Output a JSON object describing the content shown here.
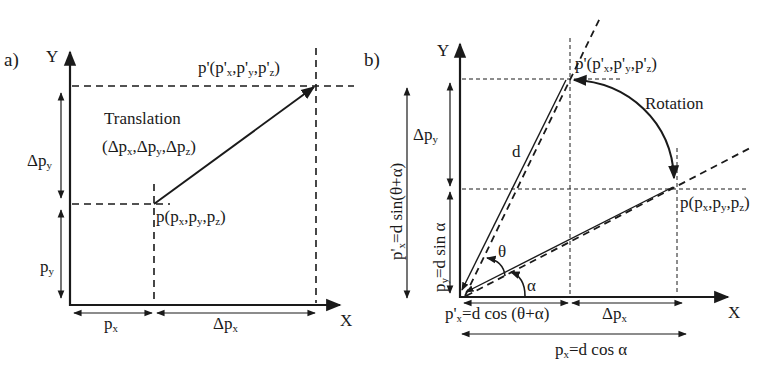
{
  "figure": {
    "background": "#ffffff",
    "ink_color": "#1a1a1a"
  },
  "panel_a": {
    "label": "a)",
    "axis_y": "Y",
    "axis_x": "X",
    "point_new": "p'(p'x,p'y,p'z)",
    "point_new_parts": {
      "p": "p'(p'",
      "x": "x",
      "c1": ",p'",
      "y": "y",
      "c2": ",p'",
      "z": "z",
      "end": ")"
    },
    "point_orig_parts": {
      "p": "p(p",
      "x": "x",
      "c1": ",p",
      "y": "y",
      "c2": ",p",
      "z": "z",
      "end": ")"
    },
    "point_orig": "p(px,py,pz)",
    "transform_title": "Translation",
    "transform_params": "(Δpx,Δpy,Δpz)",
    "transform_parts": {
      "open": "(Δp",
      "x": "x",
      "c1": ",Δp",
      "y": "y",
      "c2": ",Δp",
      "z": "z",
      "end": ")"
    },
    "dim_delta_py": {
      "base": "Δp",
      "sub": "y"
    },
    "dim_py": {
      "base": "p",
      "sub": "y"
    },
    "dim_px": {
      "base": "p",
      "sub": "x"
    },
    "dim_delta_px": {
      "base": "Δp",
      "sub": "x"
    }
  },
  "panel_b": {
    "label": "b)",
    "axis_y": "Y",
    "axis_x": "X",
    "point_new_parts": {
      "p": "p'(p'",
      "x": "x",
      "c1": ",p'",
      "y": "y",
      "c2": ",p'",
      "z": "z",
      "end": ")"
    },
    "point_new": "p'(p'x,p'y,p'z)",
    "point_orig_parts": {
      "p": "p(p",
      "x": "x",
      "c1": ",p",
      "y": "y",
      "c2": ",p",
      "z": "z",
      "end": ")"
    },
    "point_orig": "p(px,py,pz)",
    "transform_title": "Rotation",
    "radius_label": "d",
    "angle_theta": "θ",
    "angle_alpha": "α",
    "dim_delta_py": {
      "base": "Δp",
      "sub": "y"
    },
    "dim_py_new": {
      "base": "p'",
      "sub": "x",
      "rest": "=d sin(θ+α)"
    },
    "dim_py": {
      "base": "p",
      "sub": "y",
      "rest": "=d sin α"
    },
    "dim_px_new": {
      "base": "p'",
      "sub": "x",
      "rest": "=d cos (θ+α)"
    },
    "dim_delta_px": {
      "base": "Δp",
      "sub": "x"
    },
    "dim_px": {
      "base": "p",
      "sub": "x",
      "rest": "=d cos α"
    }
  }
}
